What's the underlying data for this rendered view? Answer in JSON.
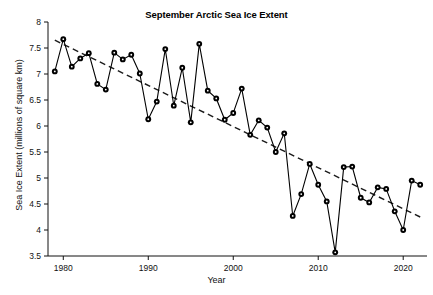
{
  "chart_data": {
    "type": "line",
    "title": "September Arctic Sea Ice Extent",
    "xlabel": "Year",
    "ylabel": "Sea Ice Extent (millions of square km)",
    "xlim": [
      1978.2,
      2022.8
    ],
    "ylim": [
      3.5,
      8
    ],
    "xticks": [
      1980,
      1990,
      2000,
      2010,
      2020
    ],
    "xticklabels": [
      "1980",
      "1990",
      "2000",
      "2010",
      "2020"
    ],
    "yticks": [
      3.5,
      4,
      4.5,
      5,
      5.5,
      6,
      6.5,
      7,
      7.5,
      8
    ],
    "yticklabels": [
      "3.5",
      "4",
      "4.5",
      "5",
      "5.5",
      "6",
      "6.5",
      "7",
      "7.5",
      "8"
    ],
    "grid": false,
    "legend": false,
    "marker": "circle-filled",
    "series": [
      {
        "name": "September Arctic Sea Ice Extent",
        "color": "#000000",
        "style": "solid-with-markers",
        "x": [
          1979,
          1980,
          1981,
          1982,
          1983,
          1984,
          1985,
          1986,
          1987,
          1988,
          1989,
          1990,
          1991,
          1992,
          1993,
          1994,
          1995,
          1996,
          1997,
          1998,
          1999,
          2000,
          2001,
          2002,
          2003,
          2004,
          2005,
          2006,
          2007,
          2008,
          2009,
          2010,
          2011,
          2012,
          2013,
          2014,
          2015,
          2016,
          2017,
          2018,
          2019,
          2020,
          2021,
          2022
        ],
        "values": [
          7.05,
          7.67,
          7.14,
          7.3,
          7.4,
          6.81,
          6.7,
          7.41,
          7.28,
          7.37,
          7.01,
          6.13,
          6.47,
          7.48,
          6.39,
          7.12,
          6.07,
          7.58,
          6.68,
          6.53,
          6.12,
          6.25,
          6.72,
          5.83,
          6.11,
          5.97,
          5.5,
          5.86,
          4.27,
          4.69,
          5.27,
          4.87,
          4.55,
          3.57,
          5.21,
          5.22,
          4.62,
          4.53,
          4.82,
          4.79,
          4.36,
          4.0,
          4.95,
          4.87
        ]
      },
      {
        "name": "Linear trend",
        "color": "#1a1a1a",
        "style": "dashed",
        "x": [
          1979,
          2022
        ],
        "values": [
          7.65,
          4.25
        ]
      }
    ]
  }
}
